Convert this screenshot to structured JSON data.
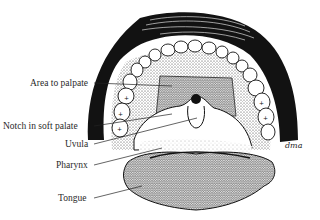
{
  "diagram": {
    "labels": [
      {
        "id": "area-to-palpate",
        "text": "Area to palpate",
        "x": 30,
        "y": 78,
        "right": 92
      },
      {
        "id": "notch-in-soft-palate",
        "text": "Notch in soft palate",
        "x": 10,
        "y": 121,
        "right": 92
      },
      {
        "id": "uvula",
        "text": "Uvula",
        "x": 65,
        "y": 139,
        "right": 92
      },
      {
        "id": "pharynx",
        "text": "Pharynx",
        "x": 56,
        "y": 160,
        "right": 92
      },
      {
        "id": "tongue",
        "text": "Tongue",
        "x": 58,
        "y": 194,
        "right": 92
      }
    ],
    "signature": "dma",
    "colors": {
      "ink": "#111111",
      "background": "#ffffff",
      "label_text": "#2a2a2a"
    }
  }
}
